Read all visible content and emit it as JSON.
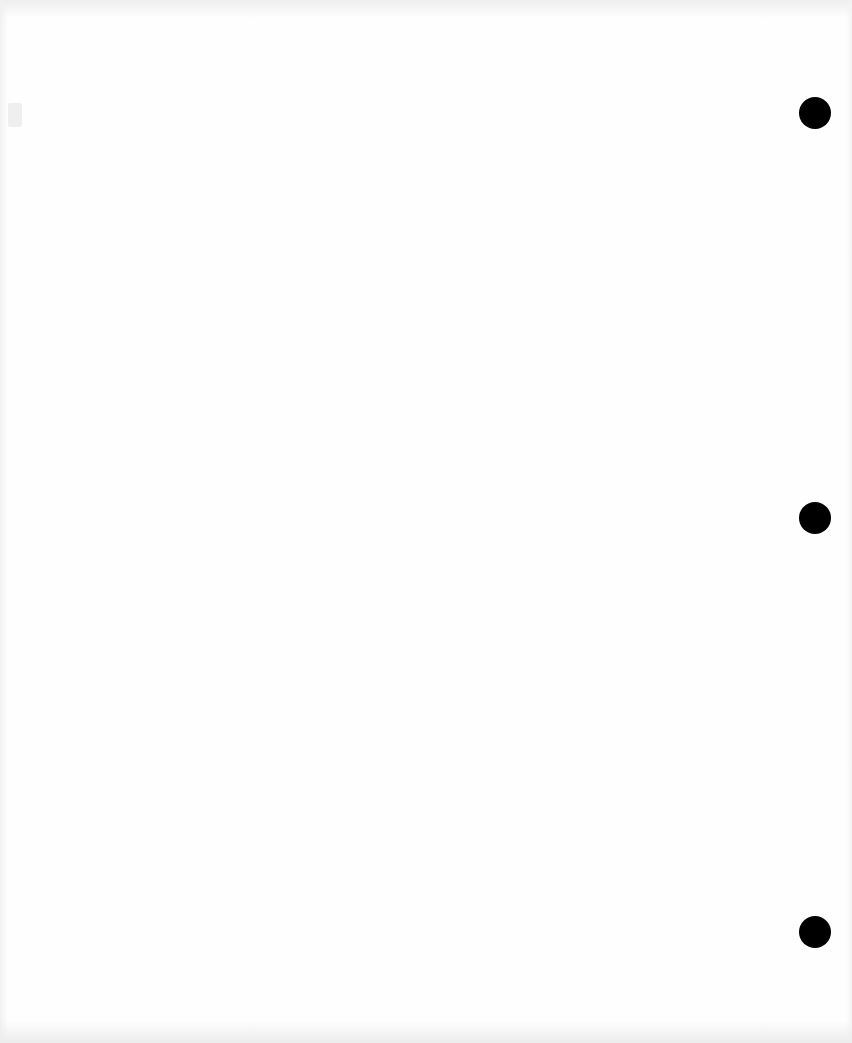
{
  "page": {
    "type": "blank scanned page",
    "background_color": "#fefefe",
    "text_content": []
  },
  "punch_holes": [
    {
      "id": "hole-top",
      "center_x": 815,
      "center_y": 113,
      "diameter": 32,
      "color": "#000000"
    },
    {
      "id": "hole-middle",
      "center_x": 815,
      "center_y": 518,
      "diameter": 32,
      "color": "#000000"
    },
    {
      "id": "hole-bottom",
      "center_x": 815,
      "center_y": 932,
      "diameter": 32,
      "color": "#000000"
    }
  ]
}
